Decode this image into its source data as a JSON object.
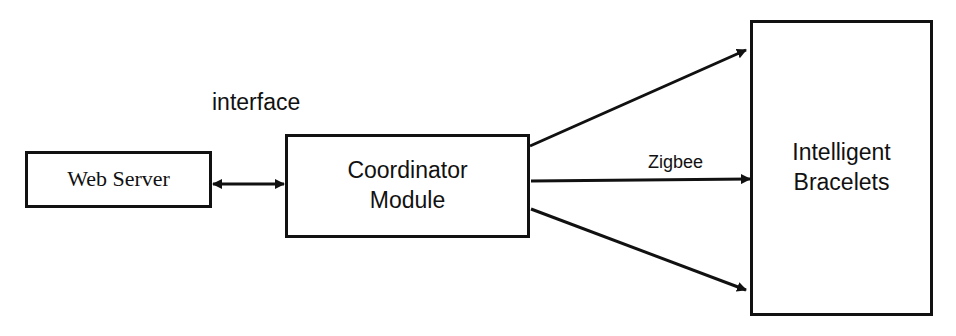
{
  "diagram": {
    "nodes": {
      "web_server": {
        "label": "Web Server"
      },
      "coordinator": {
        "line1": "Coordinator",
        "line2": "Module"
      },
      "bracelets": {
        "line1": "Intelligent",
        "line2": "Bracelets"
      }
    },
    "edges": {
      "interface": {
        "label": "interface",
        "from": "Web Server",
        "to": "Coordinator Module",
        "direction": "bidirectional"
      },
      "zigbee": {
        "label": "Zigbee",
        "from": "Coordinator Module",
        "to": "Intelligent Bracelets",
        "count": 3
      }
    },
    "colors": {
      "stroke": "#111111",
      "background": "#ffffff"
    }
  }
}
